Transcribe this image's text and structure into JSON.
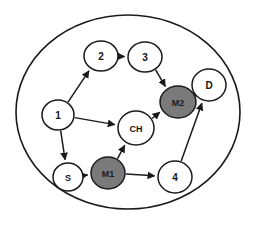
{
  "diagram": {
    "type": "directed-graph",
    "title": "",
    "boundary": {
      "shape": "ellipse",
      "cx": 128,
      "cy": 112,
      "rx": 112,
      "ry": 97,
      "stroke": "#1a1a1a"
    },
    "colors": {
      "node_fill_default": "#ffffff",
      "node_fill_highlight": "#7a7a7a",
      "stroke": "#1a1a1a",
      "label": "#141414",
      "background": "#ffffff"
    },
    "nodes": [
      {
        "id": "1",
        "label": "1",
        "cx": 58,
        "cy": 115,
        "rx": 16,
        "ry": 15,
        "fill": "white",
        "font_size": 10
      },
      {
        "id": "2",
        "label": "2",
        "cx": 101,
        "cy": 56,
        "rx": 17,
        "ry": 15,
        "fill": "white",
        "font_size": 10
      },
      {
        "id": "3",
        "label": "3",
        "cx": 145,
        "cy": 57,
        "rx": 17,
        "ry": 15,
        "fill": "white",
        "font_size": 10
      },
      {
        "id": "S",
        "label": "S",
        "cx": 68,
        "cy": 177,
        "rx": 15,
        "ry": 14,
        "fill": "white",
        "font_size": 9
      },
      {
        "id": "M1",
        "label": "M1",
        "cx": 108,
        "cy": 173,
        "rx": 17,
        "ry": 16,
        "fill": "gray",
        "font_size": 9
      },
      {
        "id": "CH",
        "label": "CH",
        "cx": 136,
        "cy": 128,
        "rx": 18,
        "ry": 17,
        "fill": "white",
        "font_size": 9
      },
      {
        "id": "M2",
        "label": "M2",
        "cx": 178,
        "cy": 102,
        "rx": 18,
        "ry": 16,
        "fill": "gray",
        "font_size": 9
      },
      {
        "id": "4",
        "label": "4",
        "cx": 175,
        "cy": 177,
        "rx": 17,
        "ry": 16,
        "fill": "white",
        "font_size": 10
      },
      {
        "id": "D",
        "label": "D",
        "cx": 209,
        "cy": 85,
        "rx": 17,
        "ry": 16,
        "fill": "white",
        "font_size": 10
      }
    ],
    "edges": [
      {
        "from": "1",
        "to": "2"
      },
      {
        "from": "2",
        "to": "3"
      },
      {
        "from": "3",
        "to": "M2"
      },
      {
        "from": "1",
        "to": "CH"
      },
      {
        "from": "1",
        "to": "S"
      },
      {
        "from": "S",
        "to": "M1"
      },
      {
        "from": "M1",
        "to": "CH"
      },
      {
        "from": "M1",
        "to": "4"
      },
      {
        "from": "CH",
        "to": "M2"
      },
      {
        "from": "M2",
        "to": "D"
      },
      {
        "from": "4",
        "to": "D"
      }
    ]
  },
  "background_bleed": {
    "line1": "",
    "line2": ""
  }
}
